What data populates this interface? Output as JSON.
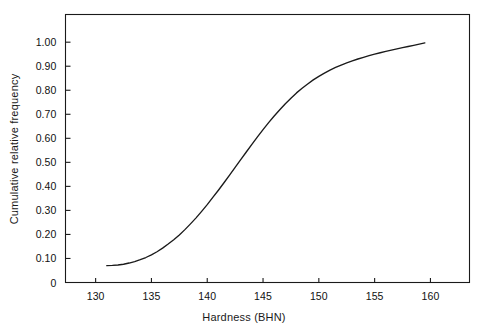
{
  "chart_data": {
    "type": "line",
    "title": "",
    "subtitle": "",
    "xlabel": "Hardness (BHN)",
    "ylabel": "Cumulative relative frequency",
    "xlim": [
      127.3,
      163.5
    ],
    "ylim": [
      0,
      1.1152
    ],
    "grid": false,
    "legend": null,
    "annotations": [],
    "xticks": [
      {
        "value": 130,
        "label": "130"
      },
      {
        "value": 135,
        "label": "135"
      },
      {
        "value": 140,
        "label": "140"
      },
      {
        "value": 145,
        "label": "145"
      },
      {
        "value": 150,
        "label": "150"
      },
      {
        "value": 155,
        "label": "155"
      },
      {
        "value": 160,
        "label": "160"
      }
    ],
    "yticks": [
      {
        "value": 0.0,
        "label": "0"
      },
      {
        "value": 0.1,
        "label": "0.10"
      },
      {
        "value": 0.2,
        "label": "0.20"
      },
      {
        "value": 0.3,
        "label": "0.30"
      },
      {
        "value": 0.4,
        "label": "0.40"
      },
      {
        "value": 0.5,
        "label": "0.50"
      },
      {
        "value": 0.6,
        "label": "0.60"
      },
      {
        "value": 0.7,
        "label": "0.70"
      },
      {
        "value": 0.8,
        "label": "0.80"
      },
      {
        "value": 0.9,
        "label": "0.90"
      },
      {
        "value": 1.0,
        "label": "1.00"
      }
    ],
    "series": [
      {
        "name": "Cumulative relative frequency",
        "color": "#1a1a1a",
        "x": [
          131.0,
          131.5,
          132.0,
          132.5,
          133.0,
          133.5,
          134.0,
          134.5,
          135.0,
          135.5,
          136.0,
          136.5,
          137.0,
          137.5,
          138.0,
          138.5,
          139.0,
          139.5,
          140.0,
          140.5,
          141.0,
          141.5,
          142.0,
          142.5,
          143.0,
          143.5,
          144.0,
          144.5,
          145.0,
          145.5,
          146.0,
          146.5,
          147.0,
          147.5,
          148.0,
          148.5,
          149.0,
          149.5,
          150.0,
          150.5,
          151.0,
          151.5,
          152.0,
          152.5,
          153.0,
          153.5,
          154.0,
          154.5,
          155.0,
          155.5,
          156.0,
          156.5,
          157.0,
          157.5,
          158.0,
          158.5,
          159.0,
          159.5
        ],
        "y": [
          0.07,
          0.071,
          0.073,
          0.076,
          0.081,
          0.087,
          0.095,
          0.104,
          0.115,
          0.128,
          0.143,
          0.16,
          0.178,
          0.198,
          0.22,
          0.244,
          0.269,
          0.296,
          0.324,
          0.354,
          0.384,
          0.415,
          0.447,
          0.479,
          0.511,
          0.543,
          0.575,
          0.606,
          0.636,
          0.665,
          0.693,
          0.719,
          0.744,
          0.767,
          0.789,
          0.808,
          0.826,
          0.843,
          0.858,
          0.871,
          0.884,
          0.895,
          0.905,
          0.914,
          0.922,
          0.93,
          0.937,
          0.944,
          0.95,
          0.956,
          0.962,
          0.967,
          0.972,
          0.977,
          0.982,
          0.987,
          0.992,
          0.997
        ]
      }
    ]
  }
}
